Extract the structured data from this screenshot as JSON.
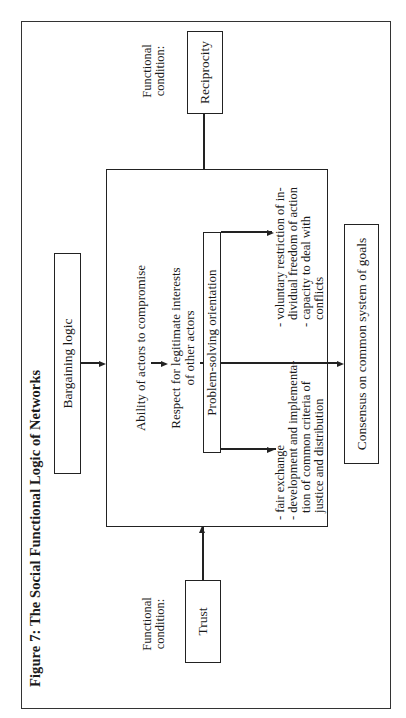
{
  "figure": {
    "title": "Figure 7: The Social Functional Logic of Networks"
  },
  "conditions": {
    "left": {
      "label_line1": "Functional",
      "label_line2": "condition:",
      "box": "Trust"
    },
    "right": {
      "label_line1": "Functional",
      "label_line2": "condition:",
      "box": "Reciprocity"
    }
  },
  "top_box": "Bargaining logic",
  "main": {
    "step1": "Ability of actors to compromise",
    "step2_line1": "Respect for legitimate interests",
    "step2_line2": "of other actors",
    "step3_box": "Problem-solving orientation",
    "left_list": [
      "- fair exchange",
      "- development and implementa-",
      "  tion of common criteria of",
      "  justice and distribution"
    ],
    "right_list": [
      "- voluntary restriction of in-",
      "  dividual freedom of action",
      "- capacity to deal with",
      "  conflicts"
    ]
  },
  "bottom_box": "Consensus on common system of goals"
}
